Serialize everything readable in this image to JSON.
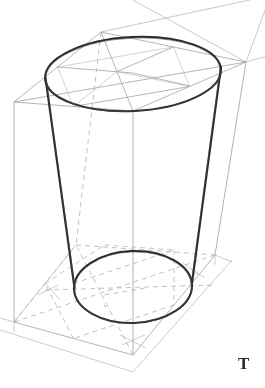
{
  "figure": {
    "medium": "pencil sketch",
    "background_color": "#ffffff",
    "labels": [
      {
        "name": "figure-label-t",
        "text": "T",
        "x": 243,
        "y": 364
      }
    ]
  },
  "colors": {
    "background": "#ffffff",
    "cylinder_outline": "#262626",
    "construction_line": "#9a9a9a",
    "construction_line_light": "#b4b4b4",
    "hidden_dashed_line": "#a8a8a8",
    "label": "#2a2a2a"
  },
  "geometry": {
    "box": {
      "name": "construction-box",
      "top_face": {
        "corners": [
          {
            "label": "front",
            "x": 133,
            "y": 111
          },
          {
            "label": "left",
            "x": 14,
            "y": 102
          },
          {
            "label": "back",
            "x": 101,
            "y": 32
          },
          {
            "label": "right",
            "x": 246,
            "y": 62
          }
        ],
        "center": {
          "x": 133,
          "y": 73
        }
      },
      "bottom_face": {
        "corners": [
          {
            "label": "front",
            "x": 133,
            "y": 355
          },
          {
            "label": "left",
            "x": 14,
            "y": 322
          },
          {
            "label": "back",
            "x": 76,
            "y": 245
          },
          {
            "label": "right",
            "x": 215,
            "y": 255
          }
        ],
        "center": {
          "x": 133,
          "y": 290
        }
      },
      "vertical_edges": [
        {
          "name": "left-edge",
          "x1": 14,
          "y1": 102,
          "x2": 14,
          "y2": 322
        },
        {
          "name": "front-edge",
          "x1": 133,
          "y1": 111,
          "x2": 133,
          "y2": 355
        },
        {
          "name": "right-edge",
          "x1": 246,
          "y1": 62,
          "x2": 215,
          "y2": 255
        },
        {
          "name": "back-edge",
          "x1": 101,
          "y1": 32,
          "x2": 76,
          "y2": 245
        }
      ]
    },
    "cylinder": {
      "name": "cylinder",
      "top_ellipse": {
        "cx": 133,
        "cy": 74,
        "rx": 88,
        "ry": 37,
        "rotation": -3
      },
      "bottom_ellipse": {
        "cx": 133,
        "cy": 287,
        "rx": 59,
        "ry": 36,
        "rotation": -2
      },
      "left_wall": {
        "x1": 46,
        "y1": 80,
        "x2": 75,
        "y2": 290
      },
      "right_wall": {
        "x1": 221,
        "y1": 68,
        "x2": 192,
        "y2": 285
      }
    },
    "vanishing_lines": [
      {
        "name": "vp-line-upper",
        "x1": 101,
        "y1": 32,
        "x2": 265,
        "y2": 0
      },
      {
        "name": "vp-line-lower",
        "x1": 246,
        "y1": 62,
        "x2": 265,
        "y2": 6
      }
    ]
  }
}
